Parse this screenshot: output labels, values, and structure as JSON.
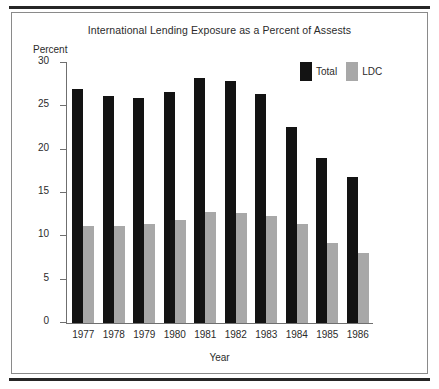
{
  "figure": {
    "title": "International Lending Exposure as a Percent of Assests",
    "y_axis_name": "Percent",
    "x_axis_name": "Year",
    "frame_border_color": "#8a8a8a",
    "rule_color": "#262626"
  },
  "legend": {
    "position": "top-right",
    "items": [
      {
        "label": "Total",
        "color": "#131313",
        "swatch": "legend-swatch-total"
      },
      {
        "label": "LDC",
        "color": "#a8a8a8",
        "swatch": "legend-swatch-ldc"
      }
    ]
  },
  "chart_data": {
    "type": "bar",
    "title": "International Lending Exposure as a Percent of Assests",
    "xlabel": "Year",
    "ylabel": "Percent",
    "ylim": [
      0,
      30
    ],
    "yticks": [
      0,
      5,
      10,
      15,
      20,
      25,
      30
    ],
    "ytick_labels": [
      "0",
      "5",
      "10",
      "15",
      "20",
      "25",
      "30"
    ],
    "grid": false,
    "legend_position": "top-right",
    "categories": [
      "1977",
      "1978",
      "1979",
      "1980",
      "1981",
      "1982",
      "1983",
      "1984",
      "1985",
      "1986"
    ],
    "series": [
      {
        "name": "Total",
        "color": "#131313",
        "values": [
          27.0,
          26.2,
          26.0,
          26.6,
          28.3,
          27.9,
          26.4,
          22.6,
          19.0,
          16.8
        ]
      },
      {
        "name": "LDC",
        "color": "#a8a8a8",
        "values": [
          11.2,
          11.2,
          11.4,
          11.9,
          12.8,
          12.7,
          12.3,
          11.4,
          9.2,
          8.1
        ]
      }
    ]
  }
}
